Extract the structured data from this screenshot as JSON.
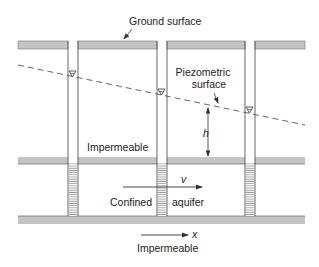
{
  "diagram": {
    "labels": {
      "ground_surface": "Ground surface",
      "piezometric_surface_line1": "Piezometric",
      "piezometric_surface_line2": "surface",
      "head": "h",
      "upper_layer": "Impermeable",
      "velocity": "v",
      "aquifer_left": "Confined",
      "aquifer_right": "aquifer",
      "x_axis": "x",
      "lower_layer": "Impermeable"
    },
    "wells": [
      {
        "name": "well-1",
        "x_left": 68,
        "x_right": 78,
        "water_level_y": 73
      },
      {
        "name": "well-2",
        "x_left": 157,
        "x_right": 167,
        "water_level_y": 91
      },
      {
        "name": "well-3",
        "x_left": 245,
        "x_right": 255,
        "water_level_y": 110
      }
    ],
    "colors": {
      "band_fill": "#c4c4c4",
      "line": "#555555",
      "screen": "#9a9a9a",
      "text": "#222222"
    }
  }
}
